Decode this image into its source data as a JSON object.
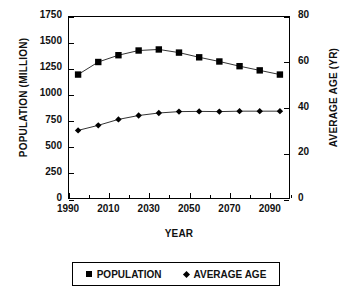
{
  "chart_data": {
    "type": "line",
    "title": "",
    "xlabel": "YEAR",
    "ylabel": "POPULATION (MILLION)",
    "ylabel_secondary": "AVERAGE AGE (YR)",
    "grid": false,
    "legend_position": "bottom",
    "xlim": [
      1990,
      2100
    ],
    "ylim": [
      0,
      1750
    ],
    "ylim_secondary": [
      0,
      80
    ],
    "xticks": [
      1990,
      2010,
      2030,
      2050,
      2070,
      2090
    ],
    "xtick_labels": [
      "1990",
      "2010",
      "2030",
      "2050",
      "2070",
      "2090"
    ],
    "xtick_minor_step": 10,
    "yticks": [
      0,
      250,
      500,
      750,
      1000,
      1250,
      1500,
      1750
    ],
    "ytick_labels": [
      "0",
      "250",
      "500",
      "750",
      "1000",
      "1250",
      "1500",
      "1750"
    ],
    "yticks_secondary": [
      0,
      20,
      40,
      60,
      80
    ],
    "ytick_labels_secondary": [
      "0",
      "20",
      "40",
      "60",
      "80"
    ],
    "x": [
      1995,
      2005,
      2015,
      2025,
      2035,
      2045,
      2055,
      2065,
      2075,
      2085,
      2095
    ],
    "series": [
      {
        "name": "POPULATION",
        "axis": "left",
        "marker": "square",
        "color": "#000000",
        "values": [
          1190,
          1310,
          1375,
          1420,
          1430,
          1400,
          1355,
          1315,
          1270,
          1230,
          1190
        ]
      },
      {
        "name": "AVERAGE AGE",
        "axis": "right",
        "marker": "diamond",
        "color": "#000000",
        "values": [
          30.0,
          32.2,
          34.8,
          36.5,
          37.6,
          38.2,
          38.3,
          38.2,
          38.4,
          38.4,
          38.4
        ]
      }
    ]
  },
  "legend": {
    "entries": [
      {
        "label": "POPULATION",
        "marker": "square"
      },
      {
        "label": "AVERAGE AGE",
        "marker": "diamond"
      }
    ]
  }
}
